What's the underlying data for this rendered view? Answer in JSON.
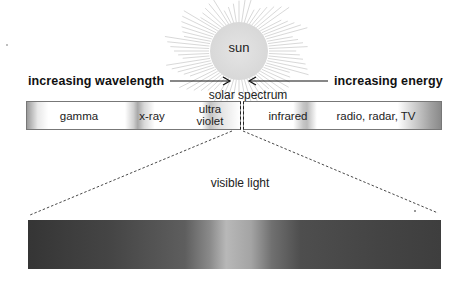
{
  "diagram": {
    "title": "solar spectrum",
    "source": {
      "label": "sun"
    },
    "arrows": {
      "left": {
        "label": "increasing wavelength",
        "direction": "right"
      },
      "right": {
        "label": "increasing energy",
        "direction": "left"
      }
    },
    "spectrum_bands": [
      {
        "id": "gamma",
        "label": "gamma"
      },
      {
        "id": "x-ray",
        "label": "x-ray"
      },
      {
        "id": "ultraviolet",
        "label_line1": "ultra",
        "label_line2": "violet"
      },
      {
        "id": "infrared",
        "label": "infrared"
      },
      {
        "id": "radio",
        "label": "radio, radar, TV"
      }
    ],
    "zoom_section": {
      "label": "visible light"
    }
  },
  "colors": {
    "background": "#ffffff",
    "text": "#1a1a1a",
    "sun_fill": "#d8d8d8",
    "visible_dark": "#353535",
    "visible_peak": "#b8b8b8"
  }
}
